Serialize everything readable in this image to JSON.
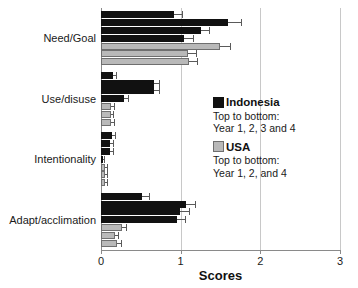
{
  "chart_data": {
    "type": "bar",
    "orientation": "horizontal",
    "title": "",
    "xlabel": "Scores",
    "ylabel": "",
    "xlim": [
      0,
      3
    ],
    "xticks": [
      0,
      1,
      2,
      3
    ],
    "xtick_labels": [
      "0",
      "1",
      "2",
      "3"
    ],
    "grid": true,
    "grid_axis": "x",
    "legend_position": "right-middle",
    "categories": [
      "Need/Goal",
      "Use/disuse",
      "Intentionality",
      "Adapt/acclimation"
    ],
    "series": [
      {
        "name": "Indonesia",
        "color": "#111111",
        "group_label": "Indonesia",
        "order_note": "Top to bottom: Year 1, 2, 3 and 4",
        "subseries": [
          {
            "name": "Year 1",
            "values": [
              0.92,
              0.15,
              0.14,
              0.52
            ],
            "errors": [
              0.1,
              0.04,
              0.04,
              0.08
            ]
          },
          {
            "name": "Year 2",
            "values": [
              1.6,
              0.66,
              0.11,
              1.07
            ],
            "errors": [
              0.16,
              0.07,
              0.04,
              0.11
            ]
          },
          {
            "name": "Year 3",
            "values": [
              1.25,
              0.66,
              0.11,
              0.99
            ],
            "errors": [
              0.1,
              0.07,
              0.04,
              0.11
            ]
          },
          {
            "name": "Year 4",
            "values": [
              1.04,
              0.29,
              0.02,
              0.96
            ],
            "errors": [
              0.12,
              0.05,
              0.02,
              0.09
            ]
          }
        ]
      },
      {
        "name": "USA",
        "color": "#b9b9b9",
        "group_label": "USA",
        "order_note": "Top to bottom: Year 1, 2, and 4",
        "subseries": [
          {
            "name": "Year 1",
            "values": [
              1.49,
              0.13,
              0.05,
              0.26
            ],
            "errors": [
              0.13,
              0.03,
              0.02,
              0.05
            ]
          },
          {
            "name": "Year 2",
            "values": [
              1.09,
              0.12,
              0.05,
              0.17
            ],
            "errors": [
              0.1,
              0.03,
              0.02,
              0.04
            ]
          },
          {
            "name": "Year 4",
            "values": [
              1.11,
              0.13,
              0.05,
              0.2
            ],
            "errors": [
              0.1,
              0.03,
              0.02,
              0.05
            ]
          }
        ]
      }
    ]
  },
  "axis": {
    "x_title": "Scores",
    "tick_labels": [
      "0",
      "1",
      "2",
      "3"
    ]
  },
  "category_labels": [
    "Need/Goal",
    "Use/disuse",
    "Intentionality",
    "Adapt/acclimation"
  ],
  "legend": {
    "entries": [
      {
        "label": "Indonesia",
        "swatch": "indonesia",
        "line1": "Top to bottom:",
        "line2": "Year 1, 2, 3 and 4"
      },
      {
        "label": "USA",
        "swatch": "usa",
        "line1": "Top to bottom:",
        "line2": "Year 1, 2, and 4"
      }
    ]
  },
  "colors": {
    "indonesia": "#111111",
    "usa": "#b9b9b9",
    "grid": "#c8c8c8",
    "axis": "#8a8a8a"
  }
}
